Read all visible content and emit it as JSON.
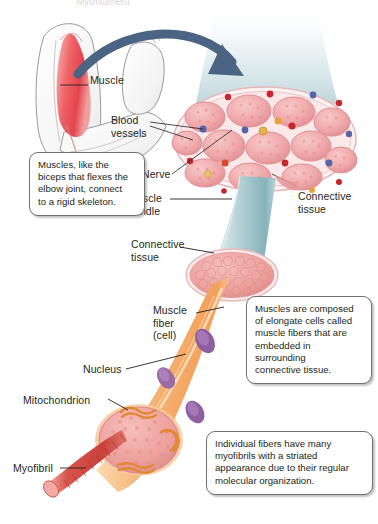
{
  "figure": {
    "title_truncated": "Myofilament"
  },
  "labels": [
    {
      "id": "muscle",
      "text": "Muscle",
      "x": 64,
      "y": 80
    },
    {
      "id": "blood-vessels",
      "text": "Blood\nvessels",
      "x": 111,
      "y": 120
    },
    {
      "id": "nerve",
      "text": "Nerve",
      "x": 142,
      "y": 176
    },
    {
      "id": "muscle-bundle",
      "text": "Muscle\nbundle",
      "x": 131,
      "y": 196
    },
    {
      "id": "connective-tissue-right",
      "text": "Connective\ntissue",
      "x": 275,
      "y": 192
    },
    {
      "id": "connective-tissue-left",
      "text": "Connective\ntissue",
      "x": 131,
      "y": 243
    },
    {
      "id": "muscle-fiber",
      "text": "Muscle\nfiber\n(cell)",
      "x": 154,
      "y": 309
    },
    {
      "id": "nucleus",
      "text": "Nucleus",
      "x": 83,
      "y": 365
    },
    {
      "id": "mitochondrion",
      "text": "Mitochondrion",
      "x": 23,
      "y": 397
    },
    {
      "id": "myofibril",
      "text": "Myofibril",
      "x": 13,
      "y": 464
    }
  ],
  "callouts": [
    {
      "id": "callout-skeleton",
      "text": "Muscles, like the\nbiceps that flexes the\nelbow joint, connect\nto a rigid skeleton.",
      "x": 29,
      "y": 152,
      "w": 116,
      "h": 56
    },
    {
      "id": "callout-fibers",
      "text": "Muscles are composed\nof elongate cells called\nmuscle fibers that are\nembedded in\nsurrounding\nconnective tissue.",
      "x": 246,
      "y": 296,
      "w": 126,
      "h": 82
    },
    {
      "id": "callout-myofibrils",
      "text": "Individual fibers have many\nmyofibrils with a striated\nappearance due to their regular\nmolecular organization.",
      "x": 206,
      "y": 431,
      "w": 167,
      "h": 57
    }
  ],
  "palette": {
    "arrow": "#4c6484",
    "muscle_red": "#e8505a",
    "bundle_teal": "#bcd6da",
    "bundle_teal_dark": "#8fb9c0",
    "tissue_pink": "#f0a8ac",
    "fascicle_pink": "#f2acae",
    "fiber_orange": "#f4a860",
    "fiber_peach": "#fad3b0",
    "nucleus_purple": "#8e5fa0",
    "mito_orange": "#e08a33",
    "myofibril_red": "#d24b43",
    "arm_outline": "#8d8d90",
    "text": "#231f20",
    "callout_border": "#6f6f6f"
  },
  "diagram_parts": {
    "arm": "flexed arm showing biceps muscle in red",
    "cross_section": "muscle cross-section with 12 fascicles, blood vessels, nerve",
    "bundle": "tapering teal muscle bundle",
    "fascicle_end": "pink fascicle cut end showing fibers",
    "fiber": "single elongate orange muscle fiber with nuclei",
    "fiber_end": "fiber cut end showing myofibrils and mitochondria",
    "myofibril": "single striated red myofibril strand"
  }
}
